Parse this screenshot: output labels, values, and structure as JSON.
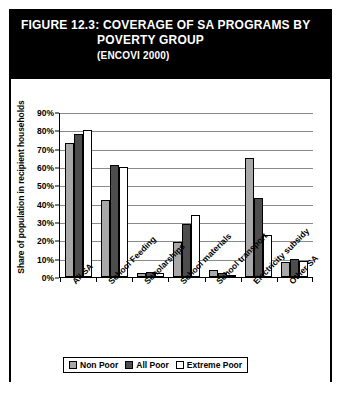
{
  "figure": {
    "title_line_1": "FIGURE 12.3:   COVERAGE OF SA PROGRAMS BY",
    "title_line_2": "POVERTY GROUP",
    "title_line_3": "(ENCOVI 2000)"
  },
  "colors": {
    "banner_background": "#000000",
    "banner_text": "#ffffff",
    "frame_border": "#000000",
    "gridline": "#8a8a8a",
    "series_non_poor": "#a8a8a8",
    "series_all_poor": "#4d4d4d",
    "series_extreme_poor": "#ffffff"
  },
  "chart_data": {
    "type": "bar",
    "title": "Coverage of SA Programs by Poverty Group (ENCOVI 2000)",
    "xlabel": "",
    "ylabel": "Share of population in recipient households",
    "ylim": [
      0,
      90
    ],
    "ytick_labels": [
      "90%",
      "80%",
      "70%",
      "60%",
      "50%",
      "40%",
      "30%",
      "20%",
      "10%",
      "0%"
    ],
    "ytick_values": [
      90,
      80,
      70,
      60,
      50,
      40,
      30,
      20,
      10,
      0
    ],
    "grid": true,
    "legend_position": "bottom",
    "categories": [
      "All SA",
      "School Feeding",
      "Scholarships",
      "School materials",
      "School transport",
      "Electricity subsidy",
      "Other SA"
    ],
    "series": [
      {
        "name": "Non Poor",
        "values": [
          73,
          42,
          2,
          19,
          4,
          65,
          8
        ]
      },
      {
        "name": "All Poor",
        "values": [
          78,
          61,
          3,
          29,
          2,
          43,
          10
        ]
      },
      {
        "name": "Extreme Poor",
        "values": [
          80,
          60,
          2,
          34,
          0,
          23,
          9
        ]
      }
    ]
  }
}
